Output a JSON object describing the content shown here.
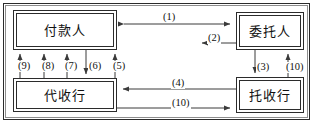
{
  "diagram": {
    "frame": {
      "border_color": "#2b2b2b",
      "inner_border_color": "#8d8d8d"
    },
    "nodes": [
      {
        "id": "payer",
        "label": "付款人"
      },
      {
        "id": "client",
        "label": "委托人"
      },
      {
        "id": "collect",
        "label": "代收行"
      },
      {
        "id": "remit",
        "label": "托收行"
      }
    ],
    "edges": [
      {
        "id": "e1",
        "label": "(1)",
        "from": "payer",
        "to": "client",
        "direction": "both"
      },
      {
        "id": "e2",
        "label": "(2)",
        "from": "client",
        "to": "payer",
        "direction": "left"
      },
      {
        "id": "e3",
        "label": "(3)",
        "from": "client",
        "to": "remit",
        "direction": "down"
      },
      {
        "id": "e10r",
        "label": "(10)",
        "from": "remit",
        "to": "client",
        "direction": "up"
      },
      {
        "id": "e4",
        "label": "(4)",
        "from": "remit",
        "to": "collect",
        "direction": "left"
      },
      {
        "id": "e10b",
        "label": "(10)",
        "from": "collect",
        "to": "remit",
        "direction": "right"
      },
      {
        "id": "e9",
        "label": "(9)",
        "from": "collect",
        "to": "payer",
        "direction": "up"
      },
      {
        "id": "e8",
        "label": "(8)",
        "from": "collect",
        "to": "payer",
        "direction": "up"
      },
      {
        "id": "e7",
        "label": "(7)",
        "from": "collect",
        "to": "payer",
        "direction": "up"
      },
      {
        "id": "e6",
        "label": "(6)",
        "from": "payer",
        "to": "collect",
        "direction": "down"
      },
      {
        "id": "e5",
        "label": "(5)",
        "from": "collect",
        "to": "payer",
        "direction": "up"
      }
    ],
    "colors": {
      "line": "#3a3a3a",
      "text": "#111111",
      "background": "#ffffff"
    }
  }
}
